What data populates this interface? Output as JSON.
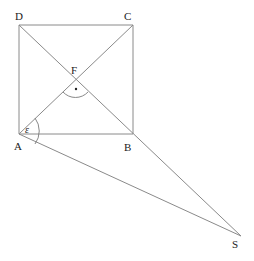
{
  "diagram": {
    "type": "geometry",
    "points": [
      {
        "id": "A",
        "label": "A",
        "x": 19,
        "y": 134
      },
      {
        "id": "B",
        "label": "B",
        "x": 133,
        "y": 134
      },
      {
        "id": "C",
        "label": "C",
        "x": 133,
        "y": 25
      },
      {
        "id": "D",
        "label": "D",
        "x": 19,
        "y": 25
      },
      {
        "id": "F",
        "label": "F",
        "x": 76,
        "y": 80
      },
      {
        "id": "S",
        "label": "S",
        "x": 241,
        "y": 236
      }
    ],
    "segments": [
      [
        "A",
        "B"
      ],
      [
        "B",
        "C"
      ],
      [
        "C",
        "D"
      ],
      [
        "D",
        "A"
      ],
      [
        "A",
        "C"
      ],
      [
        "D",
        "S"
      ],
      [
        "A",
        "S"
      ]
    ],
    "angles": [
      {
        "vertex": "F",
        "marker": "right-angle-dot",
        "label": "·"
      },
      {
        "vertex": "A",
        "marker": "arc",
        "label": "ε"
      }
    ],
    "line_color": "#8a8a8a",
    "text_color": "#222222"
  },
  "labels": {
    "A": "A",
    "B": "B",
    "C": "C",
    "D": "D",
    "F": "F",
    "S": "S",
    "epsilon": "ε",
    "right_angle_dot": "•"
  }
}
